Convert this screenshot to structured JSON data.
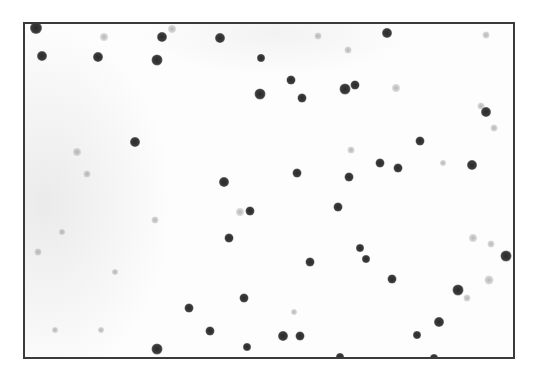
{
  "image": {
    "description": "Grayscale microscopy field with dark circular dots (stained cells/particles) scattered over a light background, enclosed in a thin dark rectangular border",
    "frame": {
      "left": 23,
      "top": 22,
      "right": 515,
      "bottom": 359,
      "border_color": "#3a3a3a"
    },
    "colors": {
      "background": "#fdfdfd",
      "dot_dark": "#2e2e2e",
      "dot_faint": "#a8a8a8"
    },
    "dark_dots": [
      [
        34,
        26,
        12
      ],
      [
        40,
        54,
        10
      ],
      [
        96,
        55,
        10
      ],
      [
        160,
        35,
        10
      ],
      [
        155,
        58,
        11
      ],
      [
        218,
        36,
        10
      ],
      [
        259,
        56,
        8
      ],
      [
        258,
        92,
        11
      ],
      [
        289,
        78,
        9
      ],
      [
        300,
        96,
        9
      ],
      [
        343,
        87,
        11
      ],
      [
        353,
        83,
        9
      ],
      [
        385,
        31,
        10
      ],
      [
        484,
        110,
        10
      ],
      [
        133,
        140,
        10
      ],
      [
        418,
        139,
        9
      ],
      [
        470,
        163,
        10
      ],
      [
        378,
        161,
        9
      ],
      [
        396,
        166,
        9
      ],
      [
        295,
        171,
        9
      ],
      [
        347,
        175,
        9
      ],
      [
        222,
        180,
        10
      ],
      [
        248,
        209,
        9
      ],
      [
        336,
        205,
        9
      ],
      [
        227,
        236,
        9
      ],
      [
        358,
        246,
        8
      ],
      [
        364,
        257,
        8
      ],
      [
        308,
        260,
        9
      ],
      [
        390,
        277,
        9
      ],
      [
        504,
        254,
        11
      ],
      [
        456,
        288,
        11
      ],
      [
        242,
        296,
        9
      ],
      [
        187,
        306,
        9
      ],
      [
        208,
        329,
        9
      ],
      [
        437,
        320,
        10
      ],
      [
        281,
        334,
        10
      ],
      [
        298,
        334,
        9
      ],
      [
        415,
        333,
        8
      ],
      [
        245,
        345,
        8
      ],
      [
        155,
        347,
        11
      ],
      [
        338,
        355,
        8
      ],
      [
        432,
        356,
        8
      ]
    ],
    "faint_dots": [
      [
        102,
        35,
        8
      ],
      [
        170,
        27,
        8
      ],
      [
        306,
        12,
        7
      ],
      [
        316,
        34,
        7
      ],
      [
        346,
        48,
        7
      ],
      [
        394,
        86,
        8
      ],
      [
        484,
        33,
        7
      ],
      [
        479,
        104,
        7
      ],
      [
        492,
        126,
        7
      ],
      [
        349,
        148,
        7
      ],
      [
        441,
        161,
        6
      ],
      [
        238,
        210,
        8
      ],
      [
        153,
        218,
        7
      ],
      [
        471,
        236,
        8
      ],
      [
        489,
        242,
        7
      ],
      [
        487,
        278,
        9
      ],
      [
        465,
        296,
        7
      ],
      [
        292,
        310,
        6
      ],
      [
        36,
        250,
        7
      ],
      [
        113,
        270,
        6
      ],
      [
        60,
        230,
        6
      ],
      [
        75,
        150,
        8
      ],
      [
        85,
        172,
        7
      ],
      [
        53,
        328,
        6
      ],
      [
        99,
        328,
        6
      ]
    ]
  }
}
